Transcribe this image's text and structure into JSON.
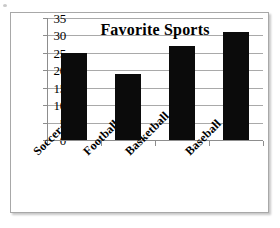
{
  "chart_data": {
    "type": "bar",
    "title": "Favorite Sports",
    "categories": [
      "Soccer",
      "Football",
      "Basketball",
      "Baseball"
    ],
    "values": [
      25,
      19,
      27,
      31
    ],
    "xlabel": "",
    "ylabel": "",
    "ylim": [
      0,
      35
    ],
    "y_ticks": [
      0,
      5,
      10,
      15,
      20,
      25,
      30,
      35
    ],
    "y_tick_labels": [
      "0",
      "5",
      "10",
      "15",
      "20",
      "25",
      "30",
      "35"
    ],
    "grid": true,
    "legend": false,
    "bar_color": "#0b0b0b",
    "gridline_color": "#a9a9a9",
    "axis_color": "#8d8d8d",
    "frame_color": "#a8a8a8"
  }
}
